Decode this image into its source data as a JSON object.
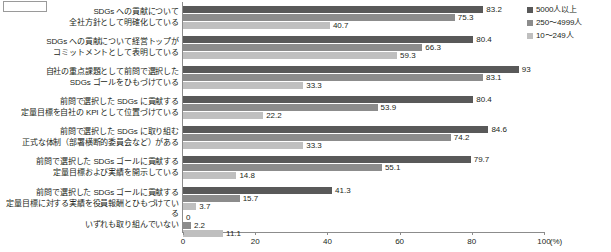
{
  "corner_box": {
    "label": ""
  },
  "legend": {
    "position": "top-right",
    "items": [
      {
        "label": "5000人以上",
        "color": "#595959"
      },
      {
        "label": "250〜4999人",
        "color": "#8c8c8c"
      },
      {
        "label": "10〜249人",
        "color": "#bfbfbf"
      }
    ]
  },
  "axis": {
    "unit": "(%)",
    "ticks": [
      "0",
      "20",
      "40",
      "60",
      "80",
      "100"
    ]
  },
  "chart_data": {
    "type": "bar",
    "orientation": "horizontal",
    "title": "",
    "xlabel": "(%)",
    "ylabel": "",
    "xlim": [
      0,
      100
    ],
    "grid": false,
    "legend_position": "top-right",
    "categories": [
      "SDGs への貢献について\n全社方針として明確化している",
      "SDGs への貢献について経営トップが\nコミットメントとして表明している",
      "自社の重点課題として前問で選択した\nSDGs ゴールをひもづけている",
      "前問で選択した SDGs に貢献する\n定量目標を自社の KPI として位置づけている",
      "前問で選択した SDGs に取り組む\n正式な体制（部署横断的委員会など）がある",
      "前問で選択した SDGs ゴールに貢献する\n定量目標および実績を開示している",
      "前問で選択した SDGs ゴールに貢献する\n定量目標に対する実績を役員報酬とひもづけている",
      "いずれも取り組んでいない"
    ],
    "series": [
      {
        "name": "5000人以上",
        "color": "#595959",
        "values": [
          83.2,
          80.4,
          93,
          80.4,
          84.6,
          79.7,
          41.3,
          0
        ]
      },
      {
        "name": "250〜4999人",
        "color": "#8c8c8c",
        "values": [
          75.3,
          66.3,
          83.1,
          53.9,
          74.2,
          55.1,
          15.7,
          2.2
        ]
      },
      {
        "name": "10〜249人",
        "color": "#bfbfbf",
        "values": [
          40.7,
          59.3,
          33.3,
          22.2,
          33.3,
          14.8,
          3.7,
          11.1
        ]
      }
    ]
  }
}
